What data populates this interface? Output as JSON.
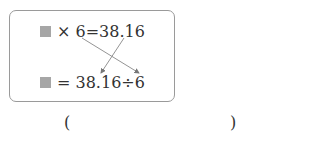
{
  "equation_box": {
    "line1": {
      "op": "×",
      "rest": "6=38.16"
    },
    "line2": {
      "op": "=",
      "rest": "38.16÷6"
    }
  },
  "answer": {
    "open": "(",
    "close": ")"
  }
}
